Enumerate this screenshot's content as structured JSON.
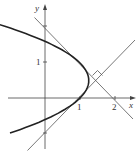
{
  "diagram": {
    "axes": {
      "x_label": "x",
      "y_label": "y",
      "x_ticks": [
        "1",
        "2"
      ],
      "y_ticks": [
        "1"
      ]
    },
    "curve": "x = 1 + y - y^2",
    "lines": [
      "y = x - 1",
      "y = -x + 2"
    ],
    "right_angle_marker": true,
    "colors": {
      "curve": "#222222",
      "lines": "#555555",
      "axes": "#444444"
    }
  }
}
